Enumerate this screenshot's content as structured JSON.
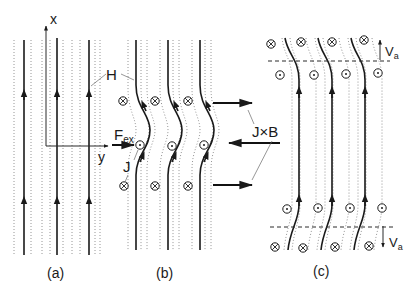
{
  "figure": {
    "panels": [
      {
        "id": "a",
        "caption": "(a)"
      },
      {
        "id": "b",
        "caption": "(b)"
      },
      {
        "id": "c",
        "caption": "(c)"
      }
    ],
    "labels": {
      "axis_x": "x",
      "axis_y": "y",
      "field": "H",
      "force_main": "F",
      "force_sub": "ex",
      "current": "J",
      "lorentz": "J×B",
      "velocity_main": "V",
      "velocity_sub": "a"
    },
    "symbols": {
      "into_page": "⊗",
      "out_of_page": "⊙"
    },
    "colors": {
      "line": "#1a1a1a",
      "dotted": "#8a8a8a",
      "background": "#ffffff"
    }
  }
}
